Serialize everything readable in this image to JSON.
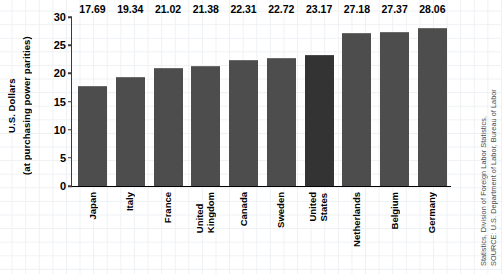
{
  "chart_data": {
    "type": "bar",
    "title": "",
    "subtitle": "",
    "xlabel": "",
    "ylabel_line1": "U.S. Dollars",
    "ylabel_line2": "(at purchasing power parities)",
    "ylim": [
      0,
      30
    ],
    "yticks": [
      0,
      5,
      10,
      15,
      20,
      25,
      30
    ],
    "ytick_labels": [
      "0",
      "5",
      "10",
      "15",
      "20",
      "25",
      "30"
    ],
    "grid": "faint-graph-paper-background",
    "legend": "none",
    "categories": [
      "Japan",
      "Italy",
      "France",
      "United Kingdom",
      "Canada",
      "Sweden",
      "United States",
      "Netherlands",
      "Belgium",
      "Germany"
    ],
    "category_lines": [
      [
        "Japan"
      ],
      [
        "Italy"
      ],
      [
        "France"
      ],
      [
        "United",
        "Kingdom"
      ],
      [
        "Canada"
      ],
      [
        "Sweden"
      ],
      [
        "United",
        "States"
      ],
      [
        "Netherlands"
      ],
      [
        "Belgium"
      ],
      [
        "Germany"
      ]
    ],
    "values": [
      17.69,
      19.34,
      21.02,
      21.38,
      22.31,
      22.72,
      23.17,
      27.18,
      27.37,
      28.06
    ],
    "value_labels": [
      "17.69",
      "19.34",
      "21.02",
      "21.38",
      "22.31",
      "22.72",
      "23.17",
      "27.18",
      "27.37",
      "28.06"
    ],
    "highlight_category": "United States",
    "bar_color": "#4d4d4d",
    "highlight_bar_color": "#333333",
    "axis_color": "#000000",
    "grid_color": "#eef1f4"
  },
  "source": {
    "line1": "SOURCE: U.S. Department of Labor, Bureau of Labor",
    "line2": "Statistics, Division of Foreign Labor Statistics,"
  }
}
